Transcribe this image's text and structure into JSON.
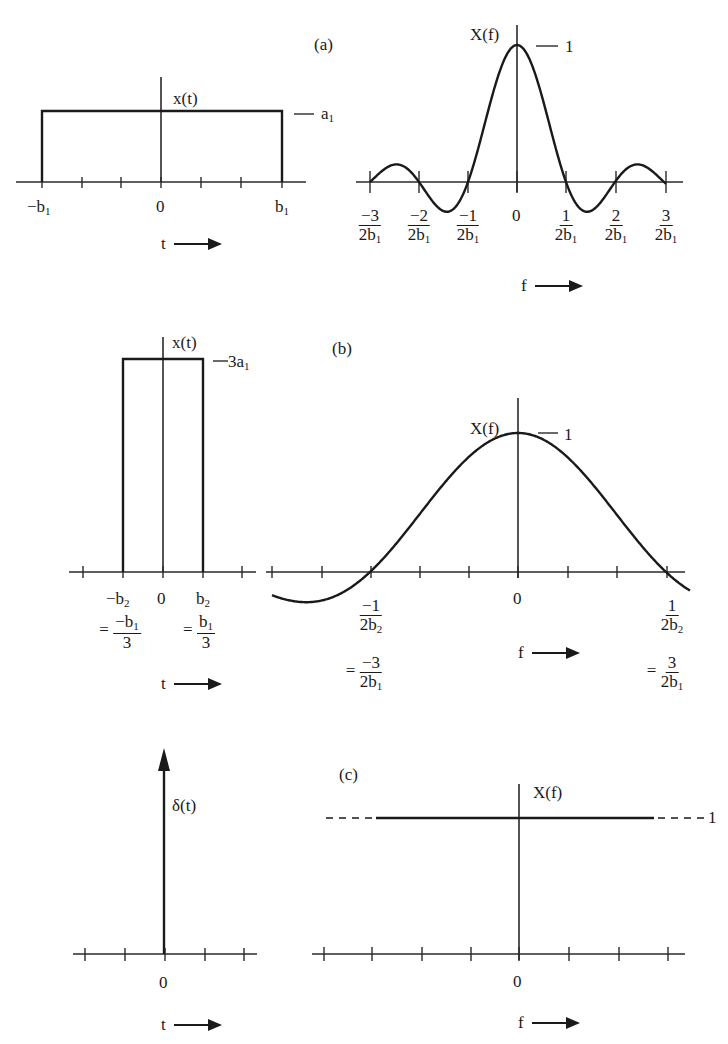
{
  "figure": {
    "panels": [
      {
        "id": "a",
        "tag": "(a)"
      },
      {
        "id": "b",
        "tag": "(b)"
      },
      {
        "id": "c",
        "tag": "(c)"
      }
    ]
  },
  "a": {
    "time": {
      "ylabel": "x(t)",
      "level_label": "a",
      "level_sub": "1",
      "ticks": [
        {
          "main": "−b",
          "sub": "1"
        },
        {
          "main": "0",
          "sub": ""
        },
        {
          "main": "b",
          "sub": "1"
        }
      ],
      "xlabel": "t"
    },
    "freq": {
      "ylabel": "X(f)",
      "peak_label": "1",
      "ticks": [
        {
          "num": "−3",
          "den": "2b",
          "sub": "1"
        },
        {
          "num": "−2",
          "den": "2b",
          "sub": "1"
        },
        {
          "num": "−1",
          "den": "2b",
          "sub": "1"
        },
        {
          "zero": "0"
        },
        {
          "num": "1",
          "den": "2b",
          "sub": "1"
        },
        {
          "num": "2",
          "den": "2b",
          "sub": "1"
        },
        {
          "num": "3",
          "den": "2b",
          "sub": "1"
        }
      ],
      "xlabel": "f"
    }
  },
  "b": {
    "time": {
      "ylabel": "x(t)",
      "level_label": "3a",
      "level_sub": "1",
      "ticks": [
        {
          "main": "−b",
          "sub": "2"
        },
        {
          "main": "0",
          "sub": ""
        },
        {
          "main": "b",
          "sub": "2"
        }
      ],
      "equiv": [
        {
          "num": "−b",
          "num_sub": "1",
          "den": "3"
        },
        {
          "num": "b",
          "num_sub": "1",
          "den": "3"
        }
      ],
      "equals": "=",
      "xlabel": "t"
    },
    "freq": {
      "ylabel": "X(f)",
      "peak_label": "1",
      "ticks": [
        {
          "num": "−1",
          "den": "2b",
          "sub": "2",
          "eq_num": "−3",
          "eq_den": "2b",
          "eq_sub": "1"
        },
        {
          "zero": "0"
        },
        {
          "num": "1",
          "den": "2b",
          "sub": "2",
          "eq_num": "3",
          "eq_den": "2b",
          "eq_sub": "1"
        }
      ],
      "equals": "=",
      "xlabel": "f"
    }
  },
  "c": {
    "time": {
      "ylabel": "δ(t)",
      "zero": "0",
      "xlabel": "t"
    },
    "freq": {
      "ylabel": "X(f)",
      "level_label": "1",
      "zero": "0",
      "xlabel": "f"
    }
  },
  "chart_data": [
    {
      "type": "line",
      "title": "(a) Rectangular pulse x(t)",
      "xlabel": "t",
      "ylabel": "x(t)",
      "x": [
        "-b1",
        "-b1",
        "b1",
        "b1"
      ],
      "values": [
        0,
        "a1",
        "a1",
        0
      ],
      "description": "Rectangular pulse of height a1 from -b1 to b1"
    },
    {
      "type": "line",
      "title": "(a) Spectrum X(f)",
      "xlabel": "f",
      "ylabel": "X(f)",
      "x_ticks": [
        "-3/(2b1)",
        "-2/(2b1)",
        "-1/(2b1)",
        "0",
        "1/(2b1)",
        "2/(2b1)",
        "3/(2b1)"
      ],
      "peak": 1,
      "zeros": [
        "±1/(2b1)",
        "±2/(2b1)",
        "±3/(2b1)"
      ],
      "description": "sinc-shaped spectrum, peak 1 at f=0"
    },
    {
      "type": "line",
      "title": "(b) Narrower pulse x(t)",
      "xlabel": "t",
      "ylabel": "x(t)",
      "x": [
        "-b2",
        "-b2",
        "b2",
        "b2"
      ],
      "values": [
        0,
        "3a1",
        "3a1",
        0
      ],
      "relations": [
        "-b2 = -b1/3",
        "b2 = b1/3"
      ]
    },
    {
      "type": "line",
      "title": "(b) Spectrum X(f)",
      "xlabel": "f",
      "ylabel": "X(f)",
      "x_ticks": [
        "-1/(2b2) = -3/(2b1)",
        "0",
        "1/(2b2) = 3/(2b1)"
      ],
      "peak": 1,
      "description": "wider sinc main lobe, zeros at ±1/(2b2)"
    },
    {
      "type": "line",
      "title": "(c) Impulse δ(t)",
      "xlabel": "t",
      "ylabel": "δ(t)",
      "x_ticks": [
        "0"
      ],
      "description": "Unit impulse at t=0"
    },
    {
      "type": "line",
      "title": "(c) Spectrum X(f)",
      "xlabel": "f",
      "ylabel": "X(f)",
      "x_ticks": [
        "0"
      ],
      "values": [
        1
      ],
      "description": "Constant spectrum equal to 1 for all f (dashed extensions)"
    }
  ]
}
